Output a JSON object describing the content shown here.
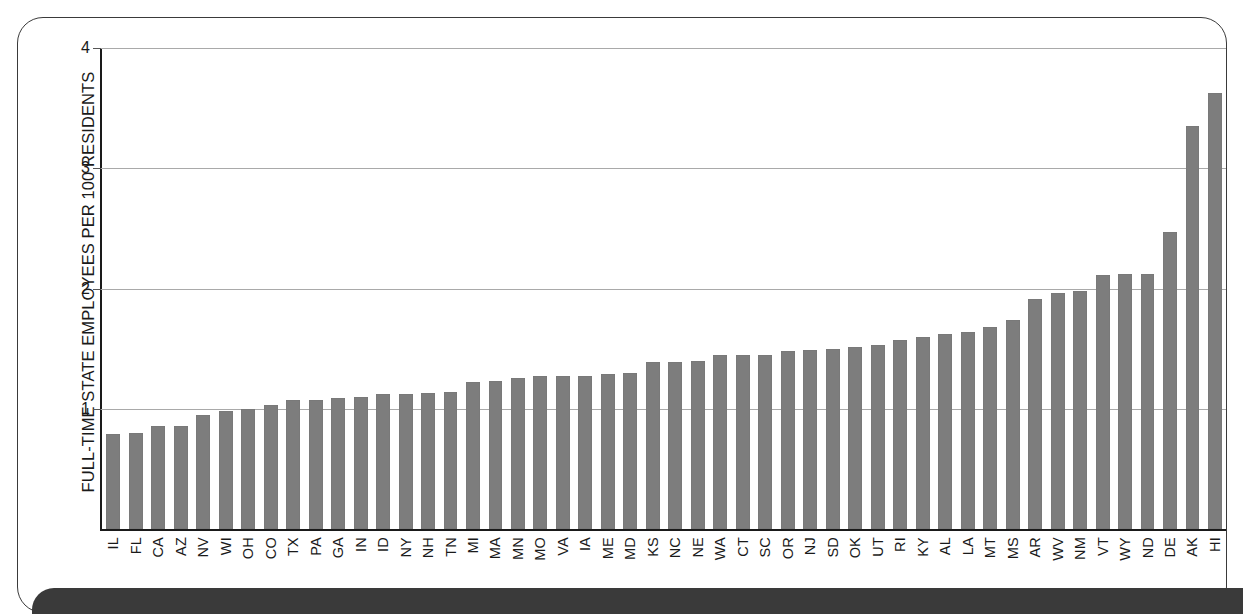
{
  "chart_data": {
    "type": "bar",
    "title": "",
    "subtitle": "",
    "xlabel": "",
    "ylabel": "FULL-TIME STATE EMPLOYEES PER 100 RESIDENTS",
    "ylim": [
      0,
      4
    ],
    "yticks": [
      "1",
      "2",
      "3",
      "4"
    ],
    "ytick_values": [
      1,
      2,
      3,
      4
    ],
    "grid": "horizontal",
    "legend": "none",
    "bar_color": "#7d7d7d",
    "categories": [
      "IL",
      "FL",
      "CA",
      "AZ",
      "NV",
      "WI",
      "OH",
      "CO",
      "TX",
      "PA",
      "GA",
      "IN",
      "ID",
      "NY",
      "NH",
      "TN",
      "MI",
      "MA",
      "MN",
      "MO",
      "VA",
      "IA",
      "ME",
      "MD",
      "KS",
      "NC",
      "NE",
      "WA",
      "CT",
      "SC",
      "OR",
      "NJ",
      "SD",
      "OK",
      "UT",
      "RI",
      "KY",
      "AL",
      "LA",
      "MT",
      "MS",
      "AR",
      "WV",
      "NM",
      "VT",
      "WY",
      "ND",
      "DE",
      "AK",
      "HI"
    ],
    "values": [
      0.79,
      0.8,
      0.86,
      0.86,
      0.95,
      0.98,
      1.0,
      1.03,
      1.07,
      1.07,
      1.09,
      1.1,
      1.12,
      1.12,
      1.13,
      1.14,
      1.22,
      1.23,
      1.26,
      1.27,
      1.27,
      1.27,
      1.29,
      1.3,
      1.39,
      1.39,
      1.4,
      1.45,
      1.45,
      1.45,
      1.48,
      1.49,
      1.5,
      1.51,
      1.53,
      1.57,
      1.6,
      1.62,
      1.64,
      1.68,
      1.74,
      1.91,
      1.96,
      1.98,
      2.11,
      2.12,
      2.12,
      2.47,
      3.35,
      3.63
    ]
  },
  "axis": {
    "y_title": "FULL-TIME STATE EMPLOYEES PER 100 RESIDENTS"
  },
  "colors": {
    "bar": "#7d7d7d",
    "gridline": "#a9a9a9",
    "axis": "#1a1a1a",
    "frame": "#3a3a3a",
    "band": "#3a3a3a",
    "background": "#ffffff"
  }
}
